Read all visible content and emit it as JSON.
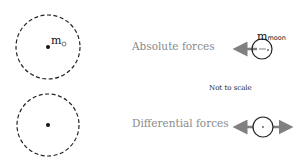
{
  "labels": {
    "absolute": "Absolute forces",
    "differential": "Differential forces",
    "note": "Not to scale",
    "earth_mass": "m",
    "earth_symbol": "⊕",
    "moon_mass": "m",
    "moon_sub": "moon"
  },
  "colors": {
    "arrow": "#808080",
    "outline": "#222222",
    "text_gray": "#8a8a8a"
  }
}
